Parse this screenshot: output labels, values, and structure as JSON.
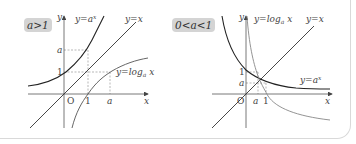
{
  "left_panel": {
    "condition_badge": "a>1",
    "axis_y_label": "y",
    "axis_x_label": "x",
    "origin_label": "O",
    "curves": {
      "exponential": {
        "label": "y=a",
        "superscript": "x",
        "color": "#222222"
      },
      "identity": {
        "label": "y=x",
        "color": "#333333"
      },
      "logarithm": {
        "label": "y=log",
        "subscript": "a",
        "tail": " x",
        "color": "#555555"
      }
    },
    "x_ticks": [
      "1",
      "a"
    ],
    "y_ticks": [
      "1",
      "a"
    ]
  },
  "right_panel": {
    "condition_badge": "0<a<1",
    "axis_y_label": "y",
    "axis_x_label": "x",
    "origin_label": "O",
    "curves": {
      "exponential": {
        "label": "y=a",
        "superscript": "x",
        "color": "#222222"
      },
      "identity": {
        "label": "y=x",
        "color": "#333333"
      },
      "logarithm": {
        "label": "y=log",
        "subscript": "a",
        "tail": " x",
        "color": "#888888"
      }
    },
    "x_ticks": [
      "a",
      "1"
    ],
    "y_ticks": [
      "1",
      "a"
    ]
  },
  "colors": {
    "badge_bg": "#d4d4d4",
    "dashed_guides": "#999999",
    "axis": "#555555",
    "frame_border": "#d9d9d9"
  }
}
